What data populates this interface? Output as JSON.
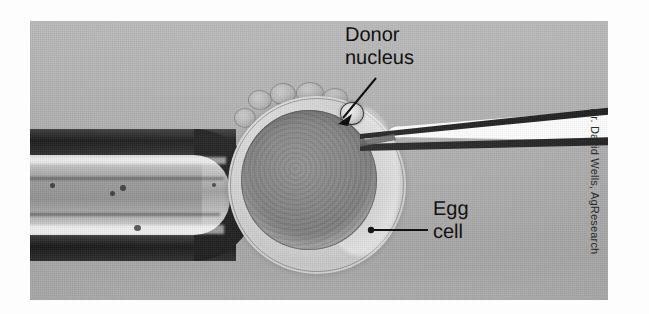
{
  "figure": {
    "kind": "microscopy-photograph",
    "background_color": "#fdfdfd",
    "photo_background_color": "#a8a8a8"
  },
  "annotations": [
    {
      "id": "donor-nucleus",
      "label": "Donor\nnucleus",
      "line_1": "Donor",
      "line_2": "nucleus",
      "leader": "arrow",
      "leader_color": "#111111"
    },
    {
      "id": "egg-cell",
      "label": "Egg\ncell",
      "line_1": "Egg",
      "line_2": "cell",
      "leader": "line-with-dot",
      "leader_color": "#111111"
    }
  ],
  "credit": {
    "text": "Dr. David Wells, AgResearch",
    "orientation": "vertical-90deg",
    "color": "#2a2a2a"
  },
  "specimen": {
    "holding_pipette_label": "holding-pipette",
    "egg_cell_label": "egg-cell",
    "injection_pipette_label": "injection-micropipette",
    "donor_nucleus_label": "donor-nucleus-cell"
  }
}
